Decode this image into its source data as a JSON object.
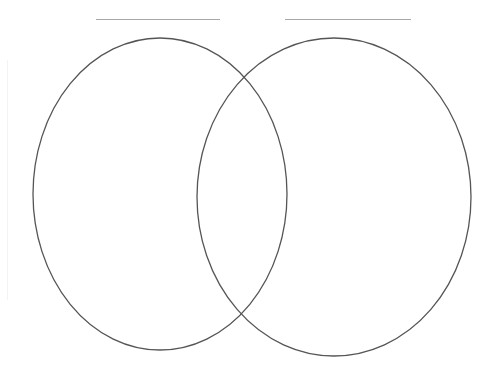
{
  "diagram": {
    "type": "venn",
    "background": "#ffffff",
    "stroke_color": "#555555",
    "label_line_color": "#a8a8a8",
    "sets": [
      {
        "name": "left-set",
        "label": "",
        "label_line": {
          "x1": 96,
          "x2": 220,
          "y": 19
        },
        "ellipse": {
          "cx": 160,
          "cy": 194,
          "rx": 127,
          "ry": 156
        }
      },
      {
        "name": "right-set",
        "label": "",
        "label_line": {
          "x1": 285,
          "x2": 411,
          "y": 19
        },
        "ellipse": {
          "cx": 334,
          "cy": 197,
          "rx": 137,
          "ry": 159
        }
      }
    ]
  }
}
